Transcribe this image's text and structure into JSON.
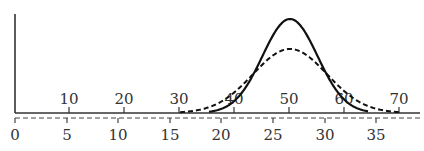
{
  "chart_data": {
    "type": "line",
    "title": "",
    "xlabel": "",
    "ylabel": "",
    "grid": false,
    "legend": null,
    "axes": {
      "upper_x": {
        "style": "solid",
        "ticks": [
          10,
          20,
          30,
          40,
          50,
          60,
          70
        ],
        "tick_labels": [
          "10",
          "20",
          "30",
          "40",
          "50",
          "60",
          "70"
        ],
        "range": [
          0,
          73
        ]
      },
      "lower_x": {
        "style": "dashed",
        "ticks": [
          0,
          5,
          10,
          15,
          20,
          25,
          30,
          35
        ],
        "tick_labels": [
          "0",
          "5",
          "10",
          "15",
          "20",
          "25",
          "30",
          "35"
        ],
        "range": [
          0,
          38
        ]
      }
    },
    "series": [
      {
        "name": "solid-normal-curve",
        "style": "solid",
        "distribution": "normal",
        "peak_upper_axis": 50,
        "peak_lower_axis": 26.7,
        "support_upper_axis": [
          35,
          64
        ],
        "relative_peak_height": 1.0
      },
      {
        "name": "dashed-normal-curve",
        "style": "dashed",
        "distribution": "normal",
        "peak_upper_axis": 50,
        "peak_lower_axis": 26.7,
        "support_upper_axis": [
          30,
          70
        ],
        "relative_peak_height": 0.68
      }
    ]
  },
  "geometry": {
    "origin_x": 15,
    "axis_top_y": 14,
    "solid_axis_y": 113,
    "dashed_axis_y": 118,
    "upper_tick_px": [
      69,
      124,
      179,
      234,
      289,
      344,
      399
    ],
    "lower_tick_px": [
      15,
      67,
      118,
      170,
      221,
      273,
      325,
      376
    ],
    "solid_curve": {
      "center": 290,
      "height": 94,
      "sigma": 27.5,
      "from": 209,
      "to": 368
    },
    "dashed_curve": {
      "center": 290,
      "height": 64,
      "sigma": 37,
      "from": 180,
      "to": 400
    }
  }
}
